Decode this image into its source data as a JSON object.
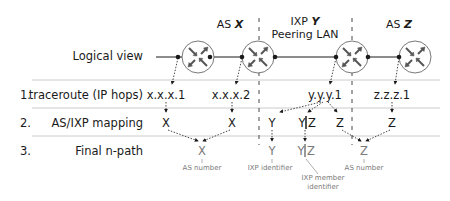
{
  "regions": {
    "as_x": {
      "prefix": "AS ",
      "name": "X"
    },
    "ixp_y": {
      "prefix": "IXP ",
      "name": "Y",
      "line2": "Peering LAN"
    },
    "as_z": {
      "prefix": "AS ",
      "name": "Z"
    }
  },
  "rows": {
    "logical": {
      "label": "Logical view"
    },
    "traceroute": {
      "number": "1.",
      "label": "traceroute (IP hops)",
      "hops": [
        "x.x.x.1",
        "x.x.x.2",
        "y.y.y.1",
        "z.z.z.1"
      ]
    },
    "mapping": {
      "number": "2.",
      "label": "AS/IXP mapping",
      "values": [
        "X",
        "X",
        "Y",
        "Y",
        "|",
        "Z",
        "Z",
        "Z"
      ]
    },
    "final": {
      "number": "3.",
      "label": "Final n-path",
      "values": [
        "X",
        "Y",
        "Y",
        "|",
        "Z",
        "Z"
      ]
    }
  },
  "annotations": {
    "as_number_1": "AS number",
    "ixp_identifier": "IXP identifier",
    "ixp_member_line1": "IXP member",
    "ixp_member_line2": "identifier",
    "as_number_2": "AS number"
  },
  "icons": {
    "router": "router-icon"
  },
  "colors": {
    "line": "#1a1a1a",
    "separator": "#cccccc",
    "muted_text": "#7a7a7a"
  }
}
